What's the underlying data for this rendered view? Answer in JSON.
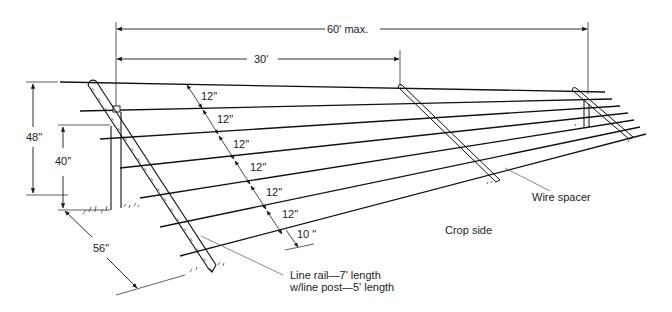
{
  "diagram": {
    "colors": {
      "line": "#1a1a1a",
      "thin": "#555555",
      "background": "#ffffff"
    },
    "dimensions": {
      "span_max": "60' max.",
      "span_spacer": "30'",
      "height_top_wire": "48\"",
      "height_post": "40\"",
      "base_offset": "56\""
    },
    "wire_spacing": [
      "12\"",
      "12\"",
      "12\"",
      "12\"",
      "12\"",
      "12\"",
      "10 \""
    ],
    "callouts": {
      "wire_spacer": "Wire spacer",
      "crop_side": "Crop side",
      "line_rail_1": "Line rail—7' length",
      "line_rail_2": "w/line post—5' length"
    }
  }
}
